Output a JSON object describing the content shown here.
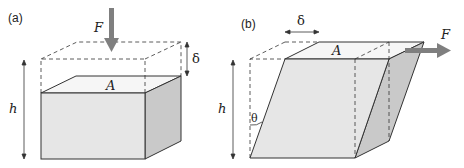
{
  "figure": {
    "panel_a": {
      "label": "(a)",
      "force": "F",
      "area": "A",
      "height": "h",
      "displacement": "δ"
    },
    "panel_b": {
      "label": "(b)",
      "force": "F",
      "area": "A",
      "height": "h",
      "displacement": "δ",
      "angle": "θ"
    }
  },
  "colors": {
    "front_face": "#e6e6e6",
    "side_face": "#c8c8c8",
    "top_face": "#f4f4f4",
    "stroke": "#333333",
    "arrow": "#7f7f7f"
  }
}
